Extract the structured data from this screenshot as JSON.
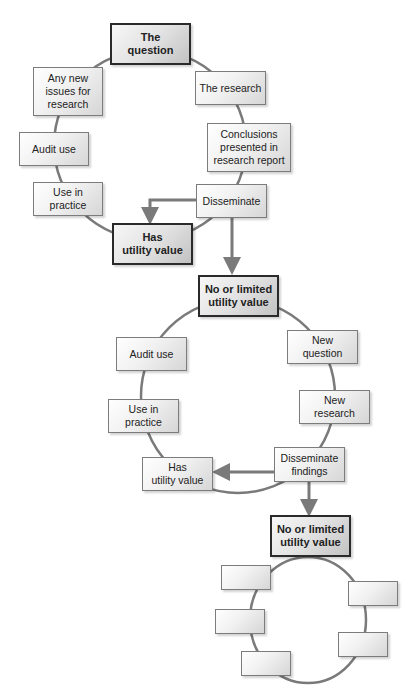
{
  "colors": {
    "line": "#7a7a7a",
    "key_border": "#2a2a2a",
    "box_border": "#7c7c7c",
    "text": "#222222"
  },
  "cycle1": {
    "start": "The question",
    "steps": [
      "The research",
      "Conclusions presented in research report",
      "Disseminate",
      "Use in practice",
      "Audit use",
      "Any new issues for research"
    ],
    "outcome_positive": "Has utility value",
    "outcome_negative": "No or limited utility value"
  },
  "cycle2": {
    "start": "No or limited utility value",
    "steps": [
      "New question",
      "New research",
      "Disseminate findings",
      "Use in practice",
      "Audit use"
    ],
    "outcome_positive": "Has utility value",
    "outcome_negative": "No or limited utility value"
  },
  "cycle3": {
    "start": "No or limited utility value",
    "empty_boxes": 5
  },
  "labels": {
    "c1_question": "The\nquestion",
    "c1_research": "The research",
    "c1_conclusions": "Conclusions\npresented in\nresearch report",
    "c1_disseminate": "Disseminate",
    "c1_has_utility": "Has\nutility value",
    "c1_use_in_practice": "Use in\npractice",
    "c1_audit_use": "Audit use",
    "c1_new_issues": "Any new\nissues for\nresearch",
    "c2_no_utility": "No or limited\nutility value",
    "c2_new_question": "New\nquestion",
    "c2_new_research": "New\nresearch",
    "c2_disseminate_findings": "Disseminate\nfindings",
    "c2_has_utility": "Has\nutility value",
    "c2_use_in_practice": "Use in\npractice",
    "c2_audit_use": "Audit use",
    "c3_no_utility": "No or limited\nutility value"
  }
}
